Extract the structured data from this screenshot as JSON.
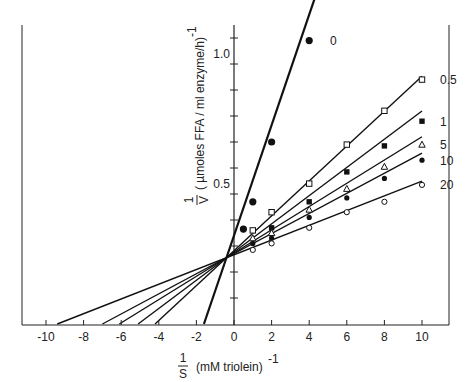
{
  "chart_data": {
    "type": "line",
    "title": "",
    "xlabel": "1/S (mM triolein)^-1",
    "ylabel": "1/V (µmoles FFA/ml enzyme/h)^-1",
    "xlabel_parts": {
      "num": "1",
      "den": "S",
      "text": "(mM triolein)",
      "exp": "-1"
    },
    "ylabel_parts": {
      "num": "1",
      "den": "V",
      "text": "( µmoles FFA / ml enzyme/h)",
      "exp": "-1"
    },
    "xlim": [
      -11.5,
      11.5
    ],
    "ylim": [
      0,
      1.2
    ],
    "x_ticks": [
      -10,
      -8,
      -6,
      -4,
      -2,
      0,
      2,
      4,
      6,
      8,
      10
    ],
    "x_tick_labels": [
      "-10",
      "-8",
      "-6",
      "-4",
      "-2",
      "0",
      "2",
      "4",
      "6",
      "8",
      "10"
    ],
    "y_ticks": [
      0.1,
      0.2,
      0.3,
      0.4,
      0.5,
      0.6,
      0.7,
      0.8,
      0.9,
      1.0,
      1.1
    ],
    "y_tick_labels": [
      {
        "value": 0.5,
        "label": "0.5"
      },
      {
        "value": 1.0,
        "label": "1.0"
      }
    ],
    "grid": false,
    "legend": "inline labels at line ends",
    "common_intersection": {
      "x": -0.4,
      "y": 0.255
    },
    "series": [
      {
        "name": "0",
        "marker": "filled-circle-large",
        "x": [
          0.5,
          1,
          2,
          4
        ],
        "values": [
          0.365,
          0.47,
          0.7,
          1.09
        ],
        "x_intercept": -1.6
      },
      {
        "name": "0.5",
        "marker": "open-square",
        "x": [
          1,
          2,
          4,
          6,
          8,
          10
        ],
        "values": [
          0.36,
          0.43,
          0.54,
          0.69,
          0.82,
          0.94
        ],
        "x_intercept": -4.2
      },
      {
        "name": "1",
        "marker": "filled-square",
        "x": [
          2,
          4,
          6,
          8,
          10
        ],
        "values": [
          0.37,
          0.47,
          0.585,
          0.685,
          0.78
        ],
        "x_intercept": -5.1
      },
      {
        "name": "5",
        "marker": "open-triangle",
        "x": [
          1,
          2,
          4,
          6,
          8,
          10
        ],
        "values": [
          0.33,
          0.35,
          0.44,
          0.52,
          0.605,
          0.69
        ],
        "x_intercept": -6.1
      },
      {
        "name": "10",
        "marker": "filled-circle",
        "x": [
          1,
          2,
          4,
          6,
          8,
          10
        ],
        "values": [
          0.31,
          0.33,
          0.41,
          0.485,
          0.56,
          0.63
        ],
        "x_intercept": -7.0
      },
      {
        "name": "20",
        "marker": "open-circle",
        "x": [
          1,
          2,
          4,
          6,
          8,
          10
        ],
        "values": [
          0.285,
          0.31,
          0.37,
          0.43,
          0.47,
          0.535
        ],
        "x_intercept": -9.4
      }
    ]
  }
}
